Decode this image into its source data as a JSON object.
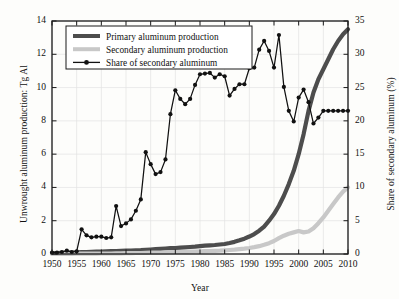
{
  "chart_data": {
    "type": "line",
    "title": "",
    "xlabel": "Year",
    "ylabel": "Unwrought aluminum production: Tg Al",
    "ylabel_right": "Share of secondary aluminum (%)",
    "xlim": [
      1950,
      2010
    ],
    "ylim": [
      0,
      14
    ],
    "ylim_right": [
      0,
      35
    ],
    "xticks": [
      1950,
      1955,
      1960,
      1965,
      1970,
      1975,
      1980,
      1985,
      1990,
      1995,
      2000,
      2005,
      2010
    ],
    "yticks_left": [
      0,
      2,
      4,
      6,
      8,
      10,
      12,
      14
    ],
    "yticks_right": [
      0,
      5,
      10,
      15,
      20,
      25,
      30,
      35
    ],
    "grid": true,
    "legend_position": "top-left",
    "colors": {
      "primary": "#4d4d4d",
      "secondary": "#c8c8c8",
      "share": "#111111",
      "grid": "#e2e2e2",
      "axis": "#1a1a1a",
      "background": "#fdfdfb"
    },
    "x": [
      1950,
      1951,
      1952,
      1953,
      1954,
      1955,
      1956,
      1957,
      1958,
      1959,
      1960,
      1961,
      1962,
      1963,
      1964,
      1965,
      1966,
      1967,
      1968,
      1969,
      1970,
      1971,
      1972,
      1973,
      1974,
      1975,
      1976,
      1977,
      1978,
      1979,
      1980,
      1981,
      1982,
      1983,
      1984,
      1985,
      1986,
      1987,
      1988,
      1989,
      1990,
      1991,
      1992,
      1993,
      1994,
      1995,
      1996,
      1997,
      1998,
      1999,
      2000,
      2001,
      2002,
      2003,
      2004,
      2005,
      2006,
      2007,
      2008,
      2009,
      2010
    ],
    "series": [
      {
        "name": "Primary aluminum production",
        "axis": "left",
        "unit": "Tg Al",
        "color": "#4d4d4d",
        "style": "thick-line",
        "values": [
          0.05,
          0.06,
          0.07,
          0.08,
          0.09,
          0.1,
          0.11,
          0.12,
          0.13,
          0.14,
          0.15,
          0.16,
          0.17,
          0.18,
          0.19,
          0.2,
          0.21,
          0.22,
          0.23,
          0.25,
          0.27,
          0.29,
          0.31,
          0.33,
          0.35,
          0.36,
          0.38,
          0.4,
          0.42,
          0.44,
          0.47,
          0.5,
          0.52,
          0.54,
          0.57,
          0.6,
          0.66,
          0.73,
          0.82,
          0.92,
          1.05,
          1.2,
          1.4,
          1.65,
          2.0,
          2.4,
          2.9,
          3.5,
          4.2,
          5.0,
          6.0,
          7.2,
          8.6,
          9.7,
          10.5,
          11.1,
          11.7,
          12.3,
          12.8,
          13.2,
          13.5
        ]
      },
      {
        "name": "Secondary aluminum production",
        "axis": "left",
        "unit": "Tg Al",
        "color": "#c8c8c8",
        "style": "thick-line",
        "values": [
          0.0,
          0.0,
          0.0,
          0.01,
          0.01,
          0.02,
          0.02,
          0.02,
          0.02,
          0.02,
          0.03,
          0.03,
          0.03,
          0.04,
          0.04,
          0.05,
          0.05,
          0.06,
          0.06,
          0.07,
          0.08,
          0.08,
          0.09,
          0.1,
          0.11,
          0.11,
          0.12,
          0.13,
          0.14,
          0.15,
          0.16,
          0.17,
          0.18,
          0.19,
          0.2,
          0.22,
          0.24,
          0.26,
          0.29,
          0.32,
          0.36,
          0.41,
          0.47,
          0.55,
          0.65,
          0.78,
          0.95,
          1.1,
          1.22,
          1.3,
          1.38,
          1.3,
          1.35,
          1.55,
          1.85,
          2.2,
          2.6,
          3.0,
          3.4,
          3.75,
          4.0
        ]
      },
      {
        "name": "Share of secondary aluminum",
        "axis": "right",
        "unit": "%",
        "color": "#111111",
        "style": "line-markers",
        "values": [
          0.2,
          0.2,
          0.3,
          0.5,
          0.3,
          0.4,
          3.7,
          2.8,
          2.5,
          2.6,
          2.6,
          2.4,
          2.5,
          7.2,
          4.2,
          4.6,
          5.2,
          6.5,
          8.2,
          15.3,
          13.5,
          12.0,
          12.3,
          14.2,
          21.0,
          24.6,
          23.3,
          22.5,
          23.3,
          25.4,
          27.0,
          27.1,
          27.2,
          26.5,
          27.0,
          26.7,
          23.8,
          24.8,
          25.5,
          25.5,
          27.9,
          28.0,
          30.7,
          32.0,
          30.5,
          28.0,
          32.9,
          25.1,
          21.5,
          19.9,
          23.5,
          24.7,
          22.8,
          19.6,
          20.5,
          21.5,
          21.5,
          21.5,
          21.5,
          21.5,
          21.5
        ]
      }
    ],
    "legend": [
      {
        "label": "Primary aluminum production",
        "color": "#4d4d4d",
        "marker": "none",
        "thickness": 4
      },
      {
        "label": "Secondary aluminum production",
        "color": "#c8c8c8",
        "marker": "none",
        "thickness": 4
      },
      {
        "label": "Share of secondary aluminum",
        "color": "#111111",
        "marker": "circle",
        "thickness": 1.3
      }
    ]
  },
  "axes": {
    "left_title": "Unwrought aluminum production: Tg Al",
    "right_title": "Share of secondary aluminum (%)",
    "bottom_title": "Year",
    "xticks": [
      "1950",
      "1955",
      "1960",
      "1965",
      "1970",
      "1975",
      "1980",
      "1985",
      "1990",
      "1995",
      "2000",
      "2005",
      "2010"
    ],
    "yticks_left": [
      "0",
      "2",
      "4",
      "6",
      "8",
      "10",
      "12",
      "14"
    ],
    "yticks_right": [
      "0",
      "5",
      "10",
      "15",
      "20",
      "25",
      "30",
      "35"
    ]
  },
  "legend": {
    "items": [
      "Primary aluminum production",
      "Secondary aluminum production",
      "Share of secondary aluminum"
    ]
  }
}
